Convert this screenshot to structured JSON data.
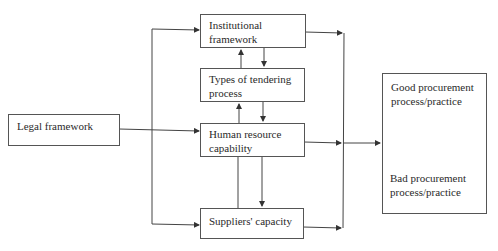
{
  "diagram": {
    "type": "flow-conceptual-framework",
    "nodes": {
      "legal": {
        "label": "Legal framework"
      },
      "institutional": {
        "line1": "Institutional",
        "line2": "framework"
      },
      "tendering": {
        "line1": "Types of tendering",
        "line2": "process"
      },
      "human": {
        "line1": "Human resource",
        "line2": "capability"
      },
      "suppliers": {
        "label": "Suppliers' capacity"
      },
      "outcome": {
        "good_line1": "Good procurement",
        "good_line2": "process/practice",
        "bad_line1": "Bad procurement",
        "bad_line2": "process/practice"
      }
    },
    "edges": [
      {
        "from": "Legal framework",
        "to": "Institutional framework"
      },
      {
        "from": "Legal framework",
        "to": "Human resource capability"
      },
      {
        "from": "Legal framework",
        "to": "Suppliers' capacity"
      },
      {
        "from": "Institutional framework",
        "to": "Types of tendering process",
        "bidirectional": true
      },
      {
        "from": "Types of tendering process",
        "to": "Human resource capability",
        "bidirectional": true
      },
      {
        "from": "Human resource capability",
        "to": "Suppliers' capacity",
        "bidirectional": true
      },
      {
        "from": "Institutional framework",
        "to": "Outcome"
      },
      {
        "from": "Human resource capability",
        "to": "Outcome"
      },
      {
        "from": "Suppliers' capacity",
        "to": "Outcome"
      },
      {
        "from": "Good procurement process/practice",
        "to": "Bad procurement process/practice",
        "bidirectional": true
      }
    ],
    "colors": {
      "line": "#444444",
      "border": "#555555",
      "background": "#ffffff"
    }
  }
}
